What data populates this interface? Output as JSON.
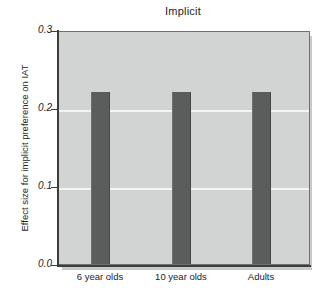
{
  "chart_data": {
    "type": "bar",
    "title": "Implicit",
    "xlabel": "",
    "ylabel": "Effect size for implicit preference on IAT",
    "categories": [
      "6 year olds",
      "10 year olds",
      "Adults"
    ],
    "values": [
      0.22,
      0.22,
      0.22
    ],
    "ylim": [
      0.0,
      0.3
    ],
    "yticks": [
      "0.0",
      "0.1",
      "0.2",
      "0.3"
    ],
    "ytick_values": [
      0.0,
      0.1,
      0.2,
      0.3
    ],
    "gridlines": [
      "0.1",
      "0.2"
    ],
    "grid": true,
    "legend": "none",
    "series": [
      {
        "name": "Effect size for implicit preference on IAT",
        "values": [
          0.22,
          0.22,
          0.22
        ]
      }
    ],
    "colors": {
      "bar": "#5b5c5c",
      "plot_background": "#d2d3d3",
      "gridline": "#f4f4f4",
      "axis": "#3c3d3d",
      "text": "#1c1c1c",
      "figure_background": "#ffffff"
    }
  }
}
